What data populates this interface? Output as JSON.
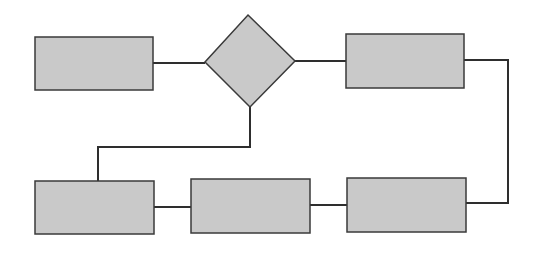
{
  "diagram": {
    "type": "flowchart",
    "colors": {
      "fill": "#c9c9c9",
      "stroke": "#3a3a3a",
      "background": "#ffffff"
    },
    "nodes": [
      {
        "id": "rect-top-left",
        "shape": "rect",
        "label": "",
        "x": 35,
        "y": 37,
        "w": 118,
        "h": 53
      },
      {
        "id": "decision-diamond",
        "shape": "diamond",
        "label": "",
        "cx": 250,
        "cy": 61,
        "rx": 45,
        "ry": 46
      },
      {
        "id": "rect-top-right",
        "shape": "rect",
        "label": "",
        "x": 346,
        "y": 34,
        "w": 118,
        "h": 54
      },
      {
        "id": "rect-bottom-left",
        "shape": "rect",
        "label": "",
        "x": 35,
        "y": 181,
        "w": 119,
        "h": 53
      },
      {
        "id": "rect-bottom-middle",
        "shape": "rect",
        "label": "",
        "x": 191,
        "y": 179,
        "w": 119,
        "h": 54
      },
      {
        "id": "rect-bottom-right",
        "shape": "rect",
        "label": "",
        "x": 347,
        "y": 178,
        "w": 119,
        "h": 54
      }
    ],
    "edges": [
      {
        "from": "rect-top-left",
        "to": "decision-diamond"
      },
      {
        "from": "decision-diamond",
        "to": "rect-top-right"
      },
      {
        "from": "rect-top-right",
        "to": "rect-bottom-right"
      },
      {
        "from": "rect-bottom-right",
        "to": "rect-bottom-middle"
      },
      {
        "from": "rect-bottom-middle",
        "to": "rect-bottom-left"
      },
      {
        "from": "decision-diamond",
        "to": "rect-bottom-left"
      }
    ]
  }
}
